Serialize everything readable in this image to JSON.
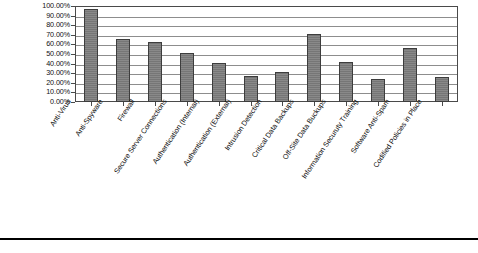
{
  "chart_data": {
    "type": "bar",
    "title": "",
    "xlabel": "",
    "ylabel": "",
    "ylim": [
      0,
      1.0
    ],
    "grid": true,
    "legend": false,
    "bar_color": "#7c7c7c",
    "bar_border_color": "#3d3d3d",
    "ytick_labels": [
      "100.00%",
      "90.00%",
      "80.00%",
      "70.00%",
      "60.00%",
      "50.00%",
      "40.00%",
      "30.00%",
      "20.00%",
      "10.00%",
      "0.00%"
    ],
    "ytick_values": [
      1.0,
      0.9,
      0.8,
      0.7,
      0.6,
      0.5,
      0.4,
      0.3,
      0.2,
      0.1,
      0.0
    ],
    "categories": [
      "Anti-Virus",
      "Anti-Spyware",
      "Firewall",
      "Secure Server Connections",
      "Authentication (Internal)",
      "Authentication (External)",
      "Intrusion Detection",
      "Critical Data Backups",
      "Off-Site Data Buckups",
      "Information Securuty Training",
      "Software Anti-Spam",
      "Codified Policies in Place"
    ],
    "values": [
      0.97,
      0.66,
      0.63,
      0.51,
      0.41,
      0.27,
      0.31,
      0.71,
      0.42,
      0.24,
      0.56,
      0.26
    ],
    "value_labels": [
      "97.00%",
      "66.00%",
      "63.00%",
      "51.00%",
      "41.00%",
      "27.00%",
      "31.00%",
      "71.00%",
      "42.00%",
      "24.00%",
      "56.00%",
      "26.00%"
    ]
  },
  "caption": {
    "text": ""
  }
}
